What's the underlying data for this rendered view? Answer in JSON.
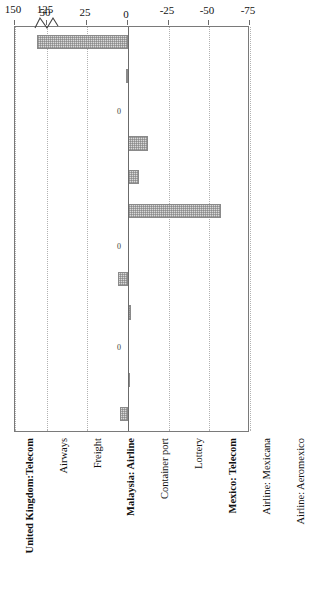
{
  "figure": {
    "axis_title": "Welfare gain/loss",
    "zero_label": "0",
    "background_color": "#ffffff",
    "bar_fill": "#d9d9d9",
    "bar_edge": "#8a8a8a",
    "grid_color": "#b2b2b2",
    "frame_color": "#7a7a7a"
  },
  "chart_data": {
    "type": "bar",
    "title": "",
    "xlabel": "",
    "ylabel": "Welfare gain/loss",
    "orientation": "vertical-rotated",
    "grid": true,
    "legend": null,
    "ylim": [
      -75,
      150
    ],
    "axis_break": {
      "present": true,
      "at": 125,
      "note": "scale break drawn at the 125 tick"
    },
    "yticks": [
      -75,
      -50,
      -25,
      0,
      25,
      50,
      125,
      150
    ],
    "ytick_labels": [
      "-75",
      "-50",
      "-25",
      "0",
      "25",
      "50",
      "125",
      "150"
    ],
    "categories": [
      "United Kingdom:Telecom",
      "Airways",
      "Freight",
      "Malaysia: Airline",
      "Container port",
      "Lottery",
      "Mexico: Telecom",
      "Airline: Mexicana",
      "Airline: Aeromexico",
      "Chile: Electrical Generation",
      "Electrical Distribution",
      "Telecom"
    ],
    "category_bold": [
      true,
      false,
      false,
      true,
      false,
      false,
      true,
      false,
      false,
      true,
      false,
      false
    ],
    "values": [
      5,
      -1,
      0,
      -2,
      6,
      0,
      -57,
      -7,
      -12,
      0,
      1.5,
      133
    ],
    "value_labels": [
      "",
      "",
      "0",
      "",
      "",
      "0",
      "",
      "",
      "",
      "0",
      "",
      ""
    ],
    "group_breaks_after": [
      2,
      5,
      8
    ]
  }
}
